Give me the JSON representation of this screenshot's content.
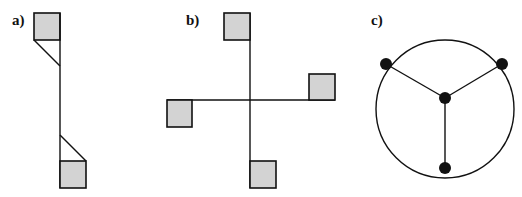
{
  "panels": [
    {
      "label": "a)",
      "description": "vertical beam with squares at ends and diagonal braces"
    },
    {
      "label": "b)",
      "description": "cross with four squares at arm ends, rotationally arranged"
    },
    {
      "label": "c)",
      "description": "circle with three boundary nodes connected to a central node"
    }
  ],
  "colors": {
    "square_fill": "#d3d3d3",
    "stroke": "#111111",
    "node": "#111111",
    "background": "#ffffff"
  }
}
